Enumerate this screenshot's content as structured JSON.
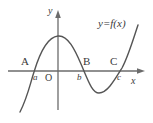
{
  "figure": {
    "stroke_color": "#555555",
    "axis_color": "#6b6b6b",
    "text_color": "#3a3a3a",
    "background": "#ffffff"
  },
  "axes": {
    "x_label": "x",
    "y_label": "y",
    "origin_label": "O"
  },
  "function_label": "y=f(x)",
  "intercepts": [
    {
      "point_label": "A",
      "value_label": "a"
    },
    {
      "point_label": "B",
      "value_label": "b"
    },
    {
      "point_label": "C",
      "value_label": "c"
    }
  ],
  "chart_data": {
    "type": "line",
    "title": "",
    "xlabel": "x",
    "ylabel": "y",
    "legend": [
      "y=f(x)"
    ],
    "grid": false,
    "annotations": [
      {
        "text": "A",
        "role": "intercept-point-label"
      },
      {
        "text": "a",
        "role": "intercept-x-value"
      },
      {
        "text": "B",
        "role": "intercept-point-label"
      },
      {
        "text": "b",
        "role": "intercept-x-value"
      },
      {
        "text": "C",
        "role": "intercept-point-label"
      },
      {
        "text": "c",
        "role": "intercept-x-value"
      },
      {
        "text": "O",
        "role": "origin"
      },
      {
        "text": "y=f(x)",
        "role": "curve-label"
      }
    ],
    "features": {
      "roots": [
        "a",
        "b",
        "c"
      ],
      "local_max_between": [
        "a",
        "b"
      ],
      "local_min_between": [
        "b",
        "c"
      ],
      "end_behavior_left": "decreasing to -infinity",
      "end_behavior_right": "increasing to +infinity"
    },
    "curve_path": "M 20,112 C 28,96 30,84 34,72 C 40,52 48,37 58,36 C 68,35 75,50 81,64 C 88,80 92,93 99,93 C 107,93 114,81 122,68 C 128,57 133,40 138,25"
  }
}
